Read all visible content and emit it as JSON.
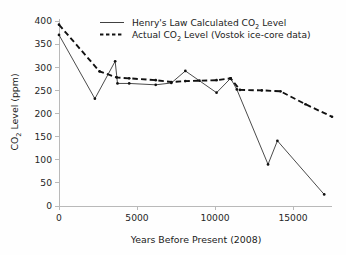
{
  "chart_data": {
    "type": "line",
    "title": "",
    "xlabel": "Years Before Present (2008)",
    "ylabel": "CO2 Level (ppm)",
    "ylabel_parts": {
      "prefix": "CO",
      "sub": "2",
      "suffix": " Level (ppm)"
    },
    "xlim": [
      0,
      17500
    ],
    "ylim": [
      0,
      400
    ],
    "xticks": [
      0,
      5000,
      10000,
      15000
    ],
    "xtick_labels": [
      "0",
      "5000",
      "10000",
      "15000"
    ],
    "yticks": [
      0,
      50,
      100,
      150,
      200,
      250,
      300,
      350,
      400
    ],
    "ytick_labels": [
      "0",
      "50",
      "100",
      "150",
      "200",
      "250",
      "300",
      "350",
      "400"
    ],
    "grid": false,
    "legend_position": "top-center",
    "series": [
      {
        "name": "Henry's Law Calculated CO2  Level",
        "name_parts": {
          "prefix": "Henry's Law Calculated CO",
          "sub": "2",
          "suffix": " Level"
        },
        "style": "solid",
        "color": "#2b2b2b",
        "x": [
          0,
          2300,
          3600,
          3750,
          4500,
          6200,
          7200,
          8100,
          10100,
          11000,
          11400,
          13400,
          14000,
          17000
        ],
        "y": [
          370,
          232,
          313,
          265,
          265,
          262,
          266,
          292,
          245,
          276,
          252,
          90,
          141,
          25
        ]
      },
      {
        "name": "Actual CO2  Level (Vostok ice-core data)",
        "name_parts": {
          "prefix": "Actual CO",
          "sub": "2",
          "suffix": " Level (Vostok ice-core data)"
        },
        "style": "dashed",
        "color": "#111111",
        "x": [
          0,
          2600,
          3700,
          4500,
          6200,
          7200,
          8100,
          9000,
          10100,
          11000,
          11600,
          13000,
          14200,
          15800,
          17500
        ],
        "y": [
          392,
          291,
          278,
          276,
          272,
          268,
          270,
          271,
          272,
          276,
          251,
          250,
          248,
          220,
          193
        ]
      }
    ]
  },
  "legend": {
    "entries": [
      {
        "label_prefix": "Henry's Law Calculated CO",
        "label_sub": "2",
        "label_suffix": " Level",
        "style": "solid"
      },
      {
        "label_prefix": "Actual CO",
        "label_sub": "2",
        "label_suffix": " Level (Vostok ice-core data)",
        "style": "dashed"
      }
    ]
  },
  "axes": {
    "x_title": "Years Before Present (2008)",
    "y_title_prefix": "CO",
    "y_title_sub": "2",
    "y_title_suffix": " Level (ppm)"
  }
}
